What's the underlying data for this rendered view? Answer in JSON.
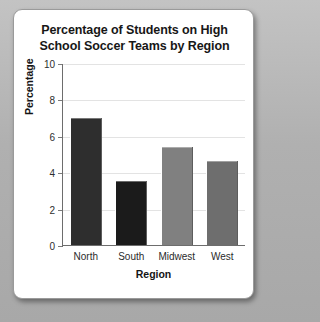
{
  "card": {
    "background": "#ffffff",
    "page_background": "#b4b4b4"
  },
  "chart_data": {
    "type": "bar",
    "title": "Percentage of Students on High School Soccer Teams by Region",
    "title_line_1": "Percentage of Students on High",
    "title_line_2": "School Soccer Teams by Region",
    "xlabel": "Region",
    "ylabel": "Percentage",
    "categories": [
      "North",
      "South",
      "Midwest",
      "West"
    ],
    "values": [
      7.0,
      3.5,
      5.4,
      4.6
    ],
    "bar_colors": [
      "#2e2e2e",
      "#1b1b1b",
      "#808080",
      "#6e6e6e"
    ],
    "ylim": [
      0,
      10
    ],
    "yticks": [
      10,
      8,
      6,
      4,
      2,
      0
    ],
    "ytick_labels": [
      "10",
      "8",
      "6",
      "4",
      "2",
      "0"
    ],
    "grid": true,
    "grid_color": "#e3e3e3",
    "legend": "none"
  }
}
